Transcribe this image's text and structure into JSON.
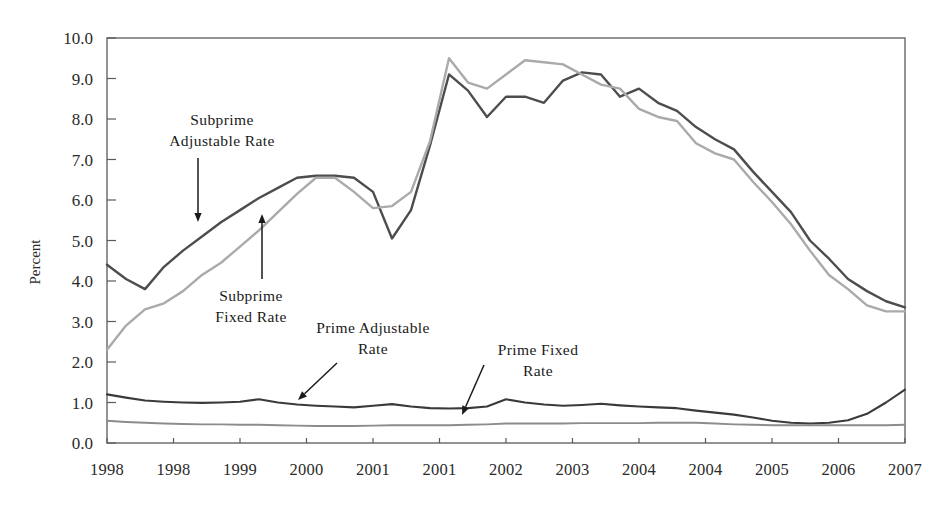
{
  "chart_data": {
    "type": "line",
    "title": "",
    "xlabel": "",
    "ylabel": "Percent",
    "ylim": [
      0.0,
      10.0
    ],
    "yticks": [
      "0.0",
      "1.0",
      "2.0",
      "3.0",
      "4.0",
      "5.0",
      "6.0",
      "7.0",
      "8.0",
      "9.0",
      "10.0"
    ],
    "ytick_values": [
      0.0,
      1.0,
      2.0,
      3.0,
      4.0,
      5.0,
      6.0,
      7.0,
      8.0,
      9.0,
      10.0
    ],
    "grid": false,
    "legend_position": "inline-annotations",
    "xtick_labels": [
      "1998",
      "1998",
      "1999",
      "2000",
      "2001",
      "2001",
      "2002",
      "2003",
      "2004",
      "2004",
      "2005",
      "2006",
      "2007"
    ],
    "xtick_positions": [
      0,
      3.5,
      7,
      10.5,
      14,
      17.5,
      21,
      24.5,
      28,
      31.5,
      35,
      38.5,
      42
    ],
    "x_index_count": 43,
    "series": [
      {
        "name": "Subprime Adjustable Rate",
        "color": "#4d4d4d",
        "width": 2.4,
        "values": [
          4.4,
          4.05,
          3.8,
          4.35,
          4.75,
          5.1,
          5.45,
          5.75,
          6.05,
          6.3,
          6.55,
          6.6,
          6.6,
          6.55,
          6.2,
          5.05,
          5.75,
          7.35,
          9.1,
          8.7,
          8.05,
          8.55,
          8.55,
          8.4,
          8.95,
          9.15,
          9.1,
          8.55,
          8.75,
          8.4,
          8.2,
          7.8,
          7.5,
          7.25,
          6.7,
          6.2,
          5.7,
          5.0,
          4.55,
          4.05,
          3.75,
          3.5,
          3.35
        ]
      },
      {
        "name": "Subprime Fixed Rate",
        "color": "#aaaaaa",
        "width": 2.4,
        "values": [
          2.3,
          2.9,
          3.3,
          3.45,
          3.75,
          4.15,
          4.45,
          4.85,
          5.25,
          5.7,
          6.15,
          6.55,
          6.55,
          6.2,
          5.8,
          5.85,
          6.2,
          7.45,
          9.5,
          8.9,
          8.75,
          9.1,
          9.45,
          9.4,
          9.35,
          9.1,
          8.85,
          8.75,
          8.25,
          8.05,
          7.95,
          7.4,
          7.15,
          7.0,
          6.45,
          5.95,
          5.4,
          4.75,
          4.15,
          3.8,
          3.4,
          3.25,
          3.25
        ]
      },
      {
        "name": "Prime Adjustable Rate",
        "color": "#3a3a3a",
        "width": 2.1,
        "values": [
          1.2,
          1.12,
          1.05,
          1.02,
          1.0,
          0.99,
          1.0,
          1.02,
          1.08,
          1.0,
          0.95,
          0.92,
          0.9,
          0.88,
          0.92,
          0.96,
          0.9,
          0.86,
          0.85,
          0.86,
          0.9,
          1.08,
          1.0,
          0.95,
          0.92,
          0.94,
          0.97,
          0.93,
          0.9,
          0.88,
          0.86,
          0.8,
          0.75,
          0.7,
          0.63,
          0.55,
          0.5,
          0.48,
          0.5,
          0.56,
          0.72,
          1.0,
          1.32
        ]
      },
      {
        "name": "Prime Fixed Rate",
        "color": "#8c8c8c",
        "width": 1.9,
        "values": [
          0.55,
          0.52,
          0.5,
          0.48,
          0.47,
          0.46,
          0.46,
          0.45,
          0.45,
          0.44,
          0.43,
          0.42,
          0.42,
          0.42,
          0.43,
          0.44,
          0.44,
          0.44,
          0.44,
          0.45,
          0.46,
          0.48,
          0.48,
          0.48,
          0.48,
          0.49,
          0.49,
          0.49,
          0.49,
          0.5,
          0.5,
          0.5,
          0.48,
          0.46,
          0.45,
          0.44,
          0.44,
          0.44,
          0.44,
          0.44,
          0.44,
          0.44,
          0.45
        ]
      }
    ],
    "annotations": [
      {
        "id": "subprime-adjustable",
        "lines": [
          "Subprime",
          "Adjustable Rate"
        ],
        "text_x": 222,
        "text_y": 125,
        "arrow": {
          "x1": 198,
          "y1": 158,
          "x2": 198,
          "y2": 222,
          "head": "down"
        }
      },
      {
        "id": "subprime-fixed",
        "lines": [
          "Subprime",
          "Fixed Rate"
        ],
        "text_x": 251,
        "text_y": 301,
        "arrow": {
          "x1": 262,
          "y1": 279,
          "x2": 262,
          "y2": 214,
          "head": "up"
        }
      },
      {
        "id": "prime-adjustable",
        "lines": [
          "Prime Adjustable",
          "Rate"
        ],
        "text_x": 373,
        "text_y": 333,
        "arrow": {
          "x1": 337,
          "y1": 363,
          "x2": 298,
          "y2": 400,
          "head": "down-left"
        }
      },
      {
        "id": "prime-fixed",
        "lines": [
          "Prime Fixed",
          "Rate"
        ],
        "text_x": 538,
        "text_y": 355,
        "arrow": {
          "x1": 484,
          "y1": 365,
          "x2": 462,
          "y2": 415,
          "head": "down-left"
        }
      }
    ]
  },
  "axis": {
    "ylabel": "Percent"
  }
}
